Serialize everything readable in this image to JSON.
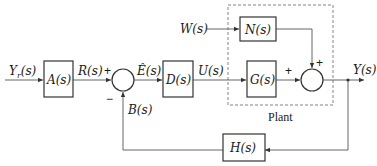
{
  "diagram": {
    "type": "control-system-block-diagram",
    "signals": {
      "input": "Y_r(s)",
      "reference": "R(s)",
      "error": "Ê(s)",
      "control": "U(s)",
      "disturbance": "W(s)",
      "output": "Y(s)",
      "feedback": "B(s)"
    },
    "blocks": {
      "A": "A(s)",
      "D": "D(s)",
      "N": "N(s)",
      "G": "G(s)",
      "H": "H(s)"
    },
    "signs": {
      "sum1_plus": "+",
      "sum1_minus": "−",
      "sum2_plus_left": "+",
      "sum2_plus_top": "+"
    },
    "group_label": "Plant",
    "colors": {
      "line": "#555555",
      "box_border": "#333333",
      "text": "#1a1a1a"
    }
  }
}
